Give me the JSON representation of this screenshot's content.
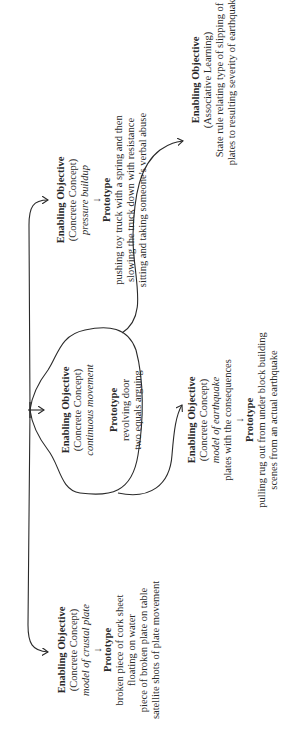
{
  "diagram": {
    "orientation": "rotated -90deg (text reads bottom-to-top)",
    "hub": {
      "label": ""
    },
    "branches": [
      {
        "id": "crustal-plate",
        "title": "Enabling Objective",
        "type": "(Concrete Concept)",
        "concept": "model of crustal plate",
        "description": "",
        "arrow": "↓",
        "prototype_title": "Prototype",
        "prototype_lines": [
          "broken piece of cork sheet",
          "floating on water",
          "piece of broken plate on table",
          "satellite shots of plate movement"
        ]
      },
      {
        "id": "continuous-movement",
        "title": "Enabling Objective",
        "type": "(Concrete Concept)",
        "concept": "continuous movement",
        "description": "",
        "arrow": "",
        "prototype_title": "Prototype",
        "prototype_lines": [
          "revolving door",
          "two equals arguing"
        ]
      },
      {
        "id": "earthquake-model",
        "title": "Enabling Objective",
        "type": "(Concrete Concept)",
        "concept": "model of earthquake",
        "description": "plates with the consequences",
        "arrow": "↓",
        "prototype_title": "Prototype",
        "prototype_lines": [
          "pulling rug out from under block building",
          "scenes from an actual earthquake"
        ]
      },
      {
        "id": "pressure-buildup",
        "title": "Enabling Objective",
        "type": "(Concrete Concept)",
        "concept": "pressure buildup",
        "description": "",
        "arrow": "↓",
        "prototype_title": "Prototype",
        "prototype_lines": [
          "pushing toy truck with a spring and then",
          "slowing the truck down with resistance",
          "sitting and taking someone's verbal abuse"
        ]
      },
      {
        "id": "associative-learning",
        "title": "Enabling Objective",
        "type": "(Associative Learning)",
        "concept": "",
        "description": "State rule relating type of slipping of plates to resulting severity of earthquake",
        "description_lines": [
          "State rule relating type of slipping of",
          "plates to resulting severity of earthquake"
        ],
        "arrow": "",
        "prototype_title": "",
        "prototype_lines": []
      }
    ]
  },
  "colors": {
    "ink": "#2a2a2a",
    "background": "#ffffff"
  }
}
